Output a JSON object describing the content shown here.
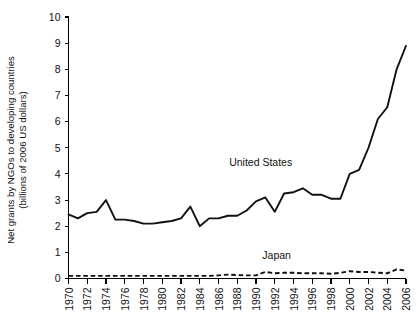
{
  "chart_data": {
    "type": "line",
    "title": "",
    "xlabel": "",
    "ylabel": "Net grants by NGOs to developing countries (billions of 2006 US dollars)",
    "ylabel_line1": "Net grants by NGOs to developing countries",
    "ylabel_line2": "(billions of 2006 US dollars)",
    "xlim": [
      1970,
      2006
    ],
    "ylim": [
      0,
      10
    ],
    "ytick_values": [
      0,
      1,
      2,
      3,
      4,
      5,
      6,
      7,
      8,
      9,
      10
    ],
    "ytick_labels": [
      "0",
      "1",
      "2",
      "3",
      "4",
      "5",
      "6",
      "7",
      "8",
      "9",
      "10"
    ],
    "xtick_values": [
      1970,
      1972,
      1974,
      1976,
      1978,
      1980,
      1982,
      1984,
      1986,
      1988,
      1990,
      1992,
      1994,
      1996,
      1998,
      2000,
      2002,
      2004,
      2006
    ],
    "xtick_labels": [
      "1970",
      "1972",
      "1974",
      "1976",
      "1978",
      "1980",
      "1982",
      "1984",
      "1986",
      "1988",
      "1990",
      "1992",
      "1994",
      "1996",
      "1998",
      "2000",
      "2002",
      "2004",
      "2006"
    ],
    "grid": false,
    "legend_position": "inline-annotation",
    "x": [
      1970,
      1971,
      1972,
      1973,
      1974,
      1975,
      1976,
      1977,
      1978,
      1979,
      1980,
      1981,
      1982,
      1983,
      1984,
      1985,
      1986,
      1987,
      1988,
      1989,
      1990,
      1991,
      1992,
      1993,
      1994,
      1995,
      1996,
      1997,
      1998,
      1999,
      2000,
      2001,
      2002,
      2003,
      2004,
      2005,
      2006
    ],
    "series": [
      {
        "name": "United States",
        "style": "solid",
        "label_x": 1990.5,
        "label_y": 4.3,
        "values": [
          2.45,
          2.3,
          2.5,
          2.55,
          3.0,
          2.25,
          2.25,
          2.2,
          2.1,
          2.1,
          2.15,
          2.2,
          2.3,
          2.75,
          2.0,
          2.3,
          2.3,
          2.4,
          2.4,
          2.6,
          2.95,
          3.1,
          2.55,
          3.25,
          3.3,
          3.45,
          3.2,
          3.2,
          3.05,
          3.05,
          4.0,
          4.15,
          5.0,
          6.1,
          6.55,
          8.0,
          8.9
        ]
      },
      {
        "name": "Japan",
        "style": "dashed",
        "label_x": 1992.2,
        "label_y": 0.75,
        "values": [
          0.1,
          0.1,
          0.1,
          0.1,
          0.1,
          0.1,
          0.1,
          0.1,
          0.1,
          0.1,
          0.1,
          0.1,
          0.1,
          0.1,
          0.1,
          0.1,
          0.12,
          0.15,
          0.13,
          0.12,
          0.12,
          0.25,
          0.2,
          0.22,
          0.22,
          0.2,
          0.2,
          0.2,
          0.18,
          0.22,
          0.28,
          0.25,
          0.25,
          0.22,
          0.2,
          0.35,
          0.3
        ]
      }
    ]
  }
}
